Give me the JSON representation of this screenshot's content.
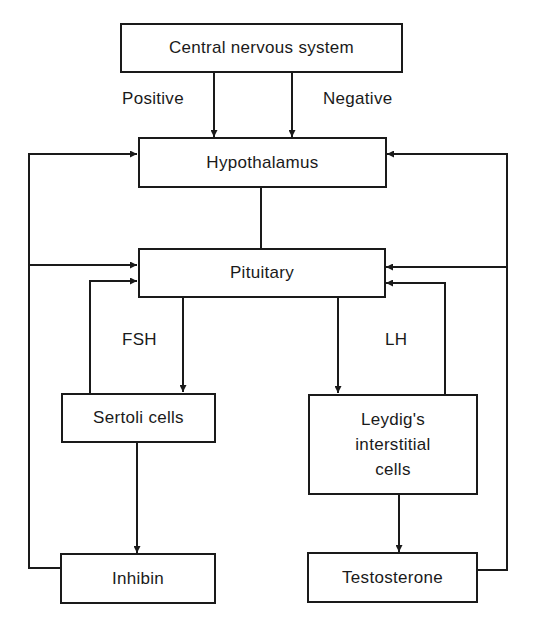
{
  "diagram": {
    "title": "",
    "nodes": {
      "cns": "Central nervous system",
      "hypothalamus": "Hypothalamus",
      "pituitary": "Pituitary",
      "sertoli": "Sertoli cells",
      "leydig_line1": "Leydig's",
      "leydig_line2": "interstitial",
      "leydig_line3": "cells",
      "inhibin": "Inhibin",
      "testosterone": "Testosterone"
    },
    "edge_labels": {
      "positive": "Positive",
      "negative": "Negative",
      "fsh": "FSH",
      "lh": "LH"
    },
    "edges": [
      {
        "from": "Central nervous system",
        "to": "Hypothalamus",
        "label": "Positive"
      },
      {
        "from": "Central nervous system",
        "to": "Hypothalamus",
        "label": "Negative"
      },
      {
        "from": "Hypothalamus",
        "to": "Pituitary",
        "label": ""
      },
      {
        "from": "Pituitary",
        "to": "Sertoli cells",
        "label": "FSH"
      },
      {
        "from": "Pituitary",
        "to": "Leydig's interstitial cells",
        "label": "LH"
      },
      {
        "from": "Sertoli cells",
        "to": "Inhibin",
        "label": ""
      },
      {
        "from": "Leydig's interstitial cells",
        "to": "Testosterone",
        "label": ""
      },
      {
        "from": "Sertoli cells",
        "to": "Pituitary",
        "label": "feedback"
      },
      {
        "from": "Leydig's interstitial cells",
        "to": "Pituitary",
        "label": "feedback"
      },
      {
        "from": "Inhibin",
        "to": "Hypothalamus",
        "label": "feedback"
      },
      {
        "from": "Inhibin",
        "to": "Pituitary",
        "label": "feedback"
      },
      {
        "from": "Testosterone",
        "to": "Hypothalamus",
        "label": "feedback"
      },
      {
        "from": "Testosterone",
        "to": "Pituitary",
        "label": "feedback"
      }
    ],
    "colors": {
      "stroke": "#1a1a1a",
      "background": "#ffffff"
    }
  }
}
